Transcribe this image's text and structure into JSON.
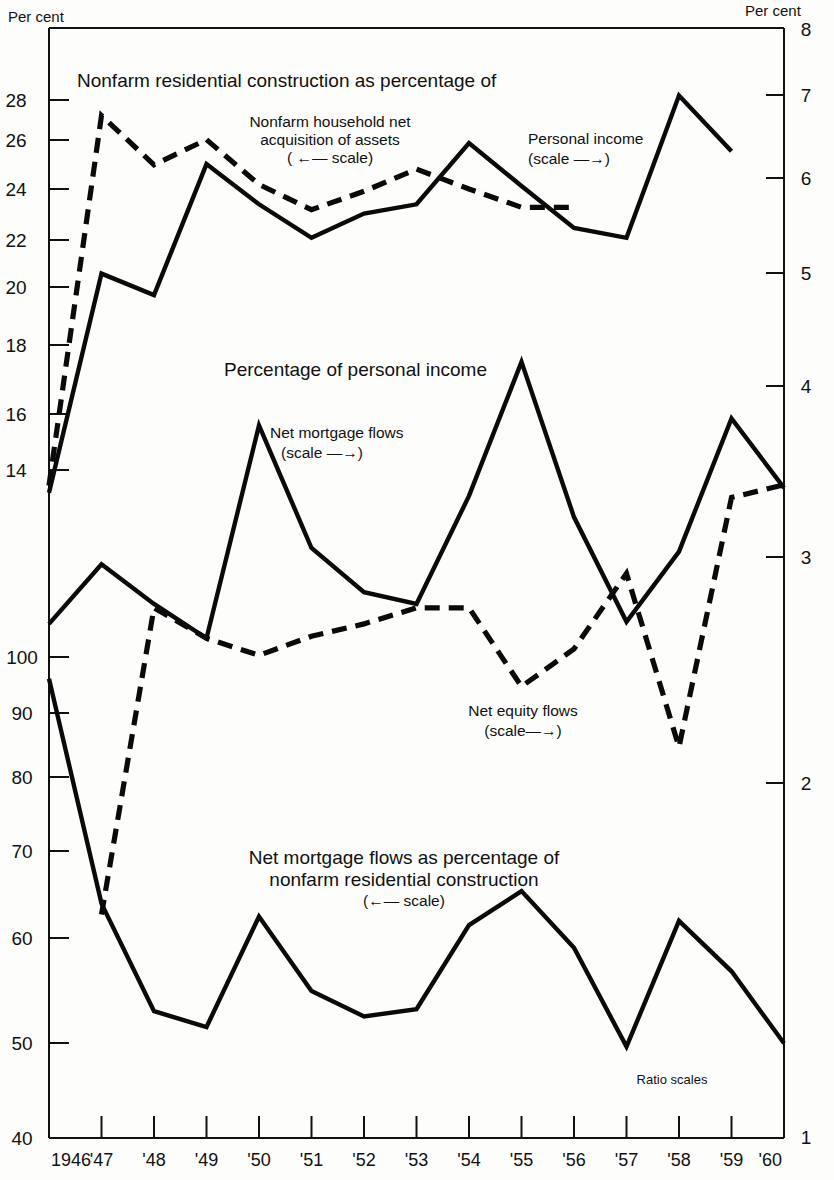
{
  "figure": {
    "left_axis_header": "Per cent",
    "right_axis_header": "Per cent",
    "note": "Ratio scales",
    "title_top": "Nonfarm residential construction as percentage of",
    "title_mid": "Percentage of personal income",
    "title_bottom_line1": "Net mortgage flows as percentage of",
    "title_bottom_line2": "nonfarm residential construction",
    "title_bottom_scale": "(←— scale)"
  },
  "annotations": {
    "assets_l1": "Nonfarm household net",
    "assets_l2": "acquisition of assets",
    "assets_scale": "( ←— scale)",
    "personal_income_l1": "Personal income",
    "personal_income_scale": "(scale —→)",
    "net_mortgage_l1": "Net mortgage flows",
    "net_mortgage_scale": "(scale —→)",
    "net_equity_l1": "Net equity flows",
    "net_equity_scale": "(scale—→)"
  },
  "chart_data": {
    "type": "line",
    "xlabel": "",
    "ylabel": "Per cent",
    "grid": false,
    "legend_position": "inline-annotations",
    "scale_note": "Ratio scales",
    "x": [
      "1946",
      "'47",
      "'48",
      "'49",
      "'50",
      "'51",
      "'52",
      "'53",
      "'54",
      "'55",
      "'56",
      "'57",
      "'58",
      "'59",
      "'60"
    ],
    "x_tick_labels": [
      "1946",
      "'47",
      "'48",
      "'49",
      "'50",
      "'51",
      "'52",
      "'53",
      "'54",
      "'55",
      "'56",
      "'57",
      "'58",
      "'59",
      "'60"
    ],
    "left_axis": {
      "label": "Per cent",
      "type": "log",
      "tick_values": [
        40,
        50,
        60,
        70,
        80,
        90,
        100,
        14,
        16,
        18,
        20,
        22,
        24,
        26,
        28
      ],
      "tick_labels": [
        "40",
        "50",
        "60",
        "70",
        "80",
        "90",
        "100",
        "14",
        "16",
        "18",
        "20",
        "22",
        "24",
        "26",
        "28"
      ],
      "range_lower_band": [
        40,
        100
      ],
      "range_upper_band": [
        13,
        30
      ]
    },
    "right_axis": {
      "label": "Per cent",
      "type": "log",
      "tick_values": [
        1,
        2,
        3,
        4,
        5,
        6,
        7,
        8
      ],
      "tick_labels": [
        "1",
        "2",
        "3",
        "4",
        "5",
        "6",
        "7",
        "8"
      ],
      "range": [
        1,
        8
      ]
    },
    "series": [
      {
        "name": "Nonfarm household net acquisition of assets",
        "style": "dashed",
        "axis": "left-upper",
        "units": "per cent",
        "values": [
          13.6,
          27.2,
          24.8,
          26.0,
          23.9,
          22.8,
          23.6,
          24.6,
          23.7,
          22.9,
          22.9,
          null,
          null,
          null,
          null
        ],
        "values_by_year": {
          "1946": 13.6,
          "1947": 27.2,
          "1948": 24.8,
          "1949": 26.0,
          "1950": 23.9,
          "1951": 22.8,
          "1952": 23.6,
          "1953": 24.6,
          "1954": 23.7,
          "1955": 22.9,
          "1956": 22.9
        },
        "note": "plotted 1946-1956 segment on left upper scale"
      },
      {
        "name": "Personal income",
        "style": "solid",
        "axis": "right",
        "units": "per cent",
        "values": [
          3.35,
          5.05,
          4.85,
          6.2,
          5.75,
          5.4,
          5.65,
          5.75,
          6.45,
          5.95,
          5.5,
          5.4,
          7.05,
          6.35,
          null
        ],
        "values_by_year": {
          "1946": 3.35,
          "1947": 5.05,
          "1948": 4.85,
          "1949": 6.2,
          "1950": 5.75,
          "1951": 5.4,
          "1952": 5.65,
          "1953": 5.75,
          "1954": 6.45,
          "1955": 5.95,
          "1956": 5.5,
          "1957": 5.4,
          "1958": 7.05,
          "1959": 6.35
        }
      },
      {
        "name": "Net mortgage flows",
        "style": "solid",
        "axis": "right",
        "units": "per cent",
        "values": [
          2.62,
          2.93,
          2.72,
          2.55,
          3.8,
          3.02,
          2.78,
          2.72,
          3.33,
          4.28,
          3.2,
          2.63,
          3.0,
          3.85,
          3.38
        ],
        "values_by_year": {
          "1946": 2.62,
          "1947": 2.93,
          "1948": 2.72,
          "1949": 2.55,
          "1950": 3.8,
          "1951": 3.02,
          "1952": 2.78,
          "1953": 2.72,
          "1954": 3.33,
          "1955": 4.28,
          "1956": 3.2,
          "1957": 2.63,
          "1958": 3.0,
          "1959": 3.85,
          "1960": 3.38
        }
      },
      {
        "name": "Net equity flows",
        "style": "dashed",
        "axis": "right",
        "units": "per cent",
        "values": [
          null,
          1.52,
          2.7,
          2.55,
          2.47,
          2.56,
          2.62,
          2.7,
          2.7,
          2.33,
          2.5,
          2.88,
          2.08,
          3.32,
          3.4
        ],
        "values_by_year": {
          "1947": 1.52,
          "1948": 2.7,
          "1949": 2.55,
          "1950": 2.47,
          "1951": 2.56,
          "1952": 2.62,
          "1953": 2.7,
          "1954": 2.7,
          "1955": 2.33,
          "1956": 2.5,
          "1957": 2.88,
          "1958": 2.08,
          "1959": 3.32,
          "1960": 3.4
        }
      },
      {
        "name": "Net mortgage flows as percentage of nonfarm residential construction",
        "style": "solid",
        "axis": "left-lower",
        "units": "per cent",
        "values": [
          96,
          63,
          51.5,
          50,
          61.5,
          53.5,
          51,
          51.7,
          60.5,
          64.5,
          58,
          48.2,
          61,
          55.5,
          48.5
        ],
        "values_by_year": {
          "1946": 96,
          "1947": 63,
          "1948": 51.5,
          "1949": 50,
          "1950": 61.5,
          "1951": 53.5,
          "1952": 51,
          "1953": 51.7,
          "1954": 60.5,
          "1955": 64.5,
          "1956": 58,
          "1957": 48.2,
          "1958": 61,
          "1959": 55.5,
          "1960": 48.5
        }
      }
    ]
  }
}
